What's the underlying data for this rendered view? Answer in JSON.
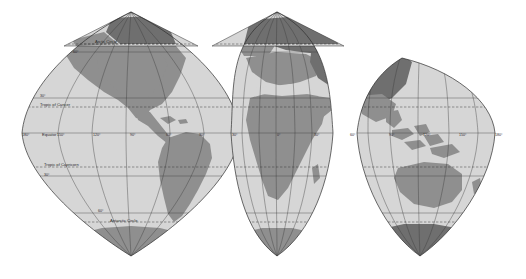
{
  "figure": {
    "name": "interrupted-world-map",
    "type": "map",
    "projection": "Interrupted gore (globular) projection",
    "background_color": "#ffffff",
    "ocean_color": "#d6d6d6",
    "land_color": "#8f8f8f",
    "land_dark_color": "#6f6f6f",
    "graticule_color": "#3a3a3a",
    "outline_color": "#2e2e2e",
    "dashed_color": "#2e2e2e"
  },
  "latitude_lines": [
    {
      "id": "arctic-circle",
      "label": "Arctic Circle",
      "style": "dashed",
      "y": 44
    },
    {
      "id": "lat-60n",
      "label": "60°",
      "style": "solid",
      "y": 52
    },
    {
      "id": "lat-30n",
      "label": "30°",
      "style": "solid",
      "y": 98
    },
    {
      "id": "tropic-of-cancer",
      "label": "Tropic of Cancer",
      "style": "dashed",
      "y": 107
    },
    {
      "id": "equator",
      "label": "Equator",
      "style": "solid",
      "y": 133
    },
    {
      "id": "tropic-of-capricorn",
      "label": "Tropic of Capricorn",
      "style": "dashed",
      "y": 167
    },
    {
      "id": "lat-30s",
      "label": "30°",
      "style": "solid",
      "y": 176
    },
    {
      "id": "antarctic-circle",
      "label": "Antarctic Circle",
      "style": "dashed",
      "y": 222
    },
    {
      "id": "lat-60s",
      "label": "60°",
      "style": "solid",
      "y": 213
    }
  ],
  "lobes": [
    {
      "id": "lobe-americas",
      "name": "Americas lobe",
      "center_longitude": "90°",
      "meridian_labels": [
        "180°",
        "150°",
        "120°",
        "90°",
        "60°",
        "30°"
      ]
    },
    {
      "id": "lobe-africa-europe",
      "name": "Europe and Africa lobe",
      "center_longitude": "0°",
      "meridian_labels": [
        "30°",
        "0°",
        "30°",
        "60°"
      ]
    },
    {
      "id": "lobe-asia-australia",
      "name": "Asia and Australia lobe",
      "center_longitude": "120°",
      "meridian_labels": [
        "90°",
        "120°",
        "150°",
        "180°"
      ]
    }
  ],
  "equator_meridian_labels": [
    {
      "text": "180°",
      "x": 22,
      "y": 136
    },
    {
      "text": "150°",
      "x": 57,
      "y": 136
    },
    {
      "text": "120°",
      "x": 93,
      "y": 136
    },
    {
      "text": "90°",
      "x": 130,
      "y": 136
    },
    {
      "text": "60°",
      "x": 166,
      "y": 136
    },
    {
      "text": "30°",
      "x": 199,
      "y": 136
    },
    {
      "text": "30°",
      "x": 232,
      "y": 136
    },
    {
      "text": "0°",
      "x": 277,
      "y": 136
    },
    {
      "text": "30°",
      "x": 314,
      "y": 136
    },
    {
      "text": "60°",
      "x": 350,
      "y": 136
    },
    {
      "text": "90°",
      "x": 389,
      "y": 136
    },
    {
      "text": "120°",
      "x": 423,
      "y": 136
    },
    {
      "text": "150°",
      "x": 459,
      "y": 136
    },
    {
      "text": "180°",
      "x": 495,
      "y": 136
    }
  ],
  "named_line_labels": [
    {
      "id": "arctic-circle-label",
      "text": "Arctic Circle",
      "x": 95,
      "y": 43
    },
    {
      "id": "lat-60n-label",
      "text": "60°",
      "x": 73,
      "y": 53
    },
    {
      "id": "lat-30n-label",
      "text": "30°",
      "x": 40,
      "y": 97
    },
    {
      "id": "tropic-of-cancer-label",
      "text": "Tropic of Cancer",
      "x": 40,
      "y": 106
    },
    {
      "id": "equator-label",
      "text": "Equator",
      "x": 42,
      "y": 136
    },
    {
      "id": "tropic-of-capricorn-label",
      "text": "Tropic of Capricorn",
      "x": 44,
      "y": 166
    },
    {
      "id": "lat-30s-label",
      "text": "30°",
      "x": 44,
      "y": 176
    },
    {
      "id": "lat-60s-label",
      "text": "60°",
      "x": 98,
      "y": 212
    },
    {
      "id": "antarctic-circle-label",
      "text": "Antarctic Circle",
      "x": 110,
      "y": 222
    }
  ]
}
